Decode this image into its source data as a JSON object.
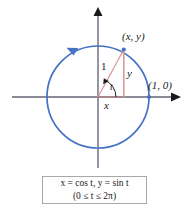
{
  "figure": {
    "background": "#ffffff",
    "colors": {
      "circle": "#4472c4",
      "axis": "#8a8a99",
      "axis_arrow": "#1a1a1a",
      "triangle": "#d99a9a",
      "leg": "#d99a9a",
      "point_marker": "#4472c4",
      "text": "#1a1a1a",
      "box_border": "#a8a8a8",
      "box_fill": "#ffffff"
    },
    "geometry": {
      "center_x": 98,
      "center_y": 97,
      "radius": 51,
      "point_angle_deg": 72
    },
    "labels": {
      "point_xy": "(x, y)",
      "point_1_0": "(1, 0)",
      "radius": "1",
      "leg_vertical": "y",
      "leg_horizontal": "x",
      "angle": "t"
    },
    "direction_arrow": {
      "name": "counterclockwise-arrow",
      "description": "arrowhead on circle at upper-left indicating counterclockwise traversal"
    },
    "axes": {
      "x_axis_arrow": "right",
      "y_axis_arrow": "up"
    }
  },
  "equation_box": {
    "line1": "x = cos t, y = sin t",
    "line2": "(0 ≤ t ≤ 2π)"
  }
}
